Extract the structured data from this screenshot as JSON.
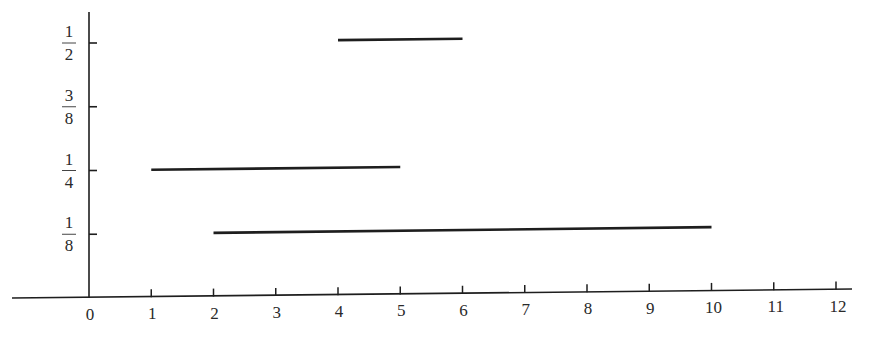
{
  "chart_data": {
    "type": "line",
    "title": "",
    "xlabel": "",
    "ylabel": "",
    "x_ticks": [
      "0",
      "1",
      "2",
      "3",
      "4",
      "5",
      "6",
      "7",
      "8",
      "9",
      "10",
      "11",
      "12"
    ],
    "y_ticks": [
      {
        "num": "1",
        "den": "8",
        "value": 0.125
      },
      {
        "num": "1",
        "den": "4",
        "value": 0.25
      },
      {
        "num": "3",
        "den": "8",
        "value": 0.375
      },
      {
        "num": "1",
        "den": "2",
        "value": 0.5
      }
    ],
    "xlim": [
      -1.3,
      12.3
    ],
    "ylim": [
      0,
      0.56
    ],
    "grid": false,
    "legend": null,
    "series": [
      {
        "name": "segment-1",
        "x": [
          1,
          5
        ],
        "y": [
          0.25,
          0.25
        ]
      },
      {
        "name": "segment-2",
        "x": [
          2,
          10
        ],
        "y": [
          0.125,
          0.125
        ]
      },
      {
        "name": "segment-3",
        "x": [
          4,
          6
        ],
        "y": [
          0.5,
          0.5
        ]
      }
    ]
  },
  "colors": {
    "ink": "#1e1e1e",
    "background": "#ffffff"
  }
}
